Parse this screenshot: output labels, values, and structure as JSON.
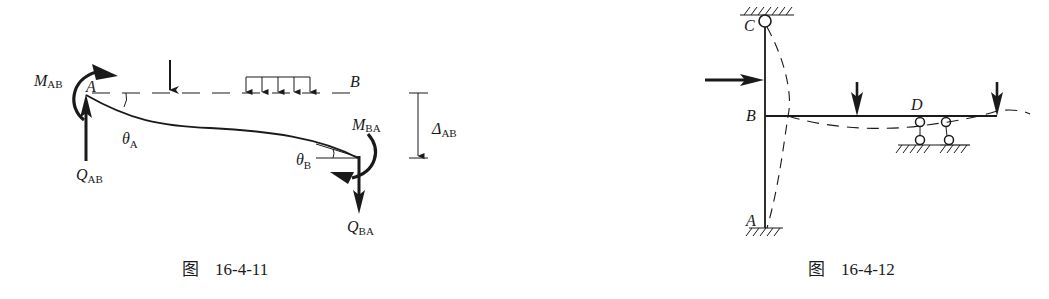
{
  "figures": [
    {
      "id": "fig-16-4-11",
      "caption": {
        "prefix": "图",
        "number": "16-4-11"
      },
      "labels": {
        "M_AB": {
          "main": "M",
          "sub": "AB"
        },
        "A": "A",
        "B": "B",
        "theta_A": {
          "main": "θ",
          "sub": "A"
        },
        "theta_B": {
          "main": "θ",
          "sub": "B"
        },
        "M_BA": {
          "main": "M",
          "sub": "BA"
        },
        "Q_AB": {
          "main": "Q",
          "sub": "AB"
        },
        "Q_BA": {
          "main": "Q",
          "sub": "BA"
        },
        "Delta_AB": {
          "main": "Δ",
          "sub": "AB"
        }
      },
      "elements": [
        "deflected-beam",
        "original-axis-dashed",
        "point-load",
        "distributed-load",
        "end-moments",
        "end-shears",
        "displacement-dimension"
      ]
    },
    {
      "id": "fig-16-4-12",
      "caption": {
        "prefix": "图",
        "number": "16-4-12"
      },
      "labels": {
        "C": "C",
        "B": "B",
        "A": "A",
        "D": "D"
      },
      "elements": [
        "column-CA",
        "beam-BD",
        "hinge-support-C",
        "fixed-support-A",
        "link-supports-D",
        "horizontal-load",
        "vertical-loads",
        "deflected-shape-dashed"
      ]
    }
  ]
}
